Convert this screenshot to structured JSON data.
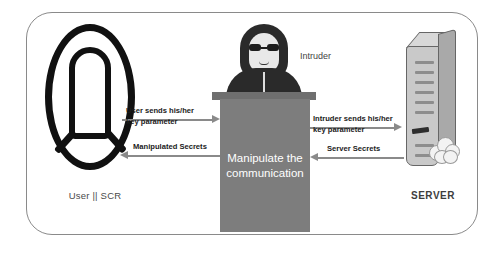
{
  "diagram": {
    "frame": {
      "border_color": "#8a8a8a",
      "background": "#ffffff"
    },
    "actors": {
      "user": {
        "label": "User || SCR",
        "icon": "user-head-outline-icon",
        "color": "#111111"
      },
      "intruder": {
        "label": "Intruder",
        "icon": "hooded-intruder-icon",
        "hood_color": "#2a2a2a",
        "face_color": "#e8e8e8",
        "glasses_color": "#1d1d1d"
      },
      "server": {
        "label": "SERVER",
        "icon": "server-tower-icon",
        "body_color": "#c9c9c9",
        "side_color": "#a9a9a9",
        "cloud_icon": "cloud-icon"
      }
    },
    "center_box": {
      "line1": "Manipulate the",
      "line2": "communication",
      "fill": "#7d7d7d",
      "text_color": "#ffffff"
    },
    "flows": [
      {
        "id": "user-to-intruder",
        "direction": "right",
        "line1": "User sends his/her",
        "line2": "key parameter",
        "color": "#8a8a8a"
      },
      {
        "id": "intruder-to-user",
        "direction": "left",
        "line1": "Manipulated Secrets",
        "line2": "",
        "color": "#8a8a8a"
      },
      {
        "id": "intruder-to-server",
        "direction": "right",
        "line1": "Intruder sends his/her",
        "line2": "key parameter",
        "color": "#8a8a8a"
      },
      {
        "id": "server-to-intruder",
        "direction": "left",
        "line1": "Server Secrets",
        "line2": "",
        "color": "#8a8a8a"
      }
    ]
  }
}
